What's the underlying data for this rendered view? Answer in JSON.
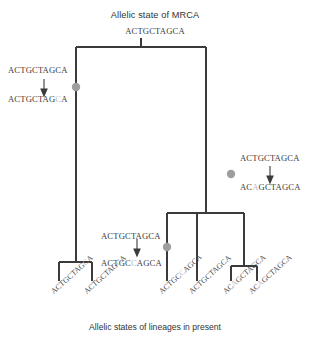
{
  "title": "Allelic state of MRCA",
  "caption": "Allelic states of lineages in present",
  "root": {
    "sequence": "ACTGCTAGCA"
  },
  "colors": {
    "branch": "#3b3b3b",
    "mutation_dot": "#9e9e9e",
    "mutant_base": "#bdbdbd",
    "text": "#333333"
  },
  "mutations": [
    {
      "id": "mutation-left",
      "before": "ACTGCTAGCA",
      "after_prefix": "ACTGCTAG",
      "after_mutant": "C",
      "after_suffix": "A",
      "dot_x": 76,
      "dot_y": 87
    },
    {
      "id": "mutation-middle",
      "before": "ACTGCTAGCA",
      "after_prefix": "ACTGC",
      "after_mutant": "C",
      "after_suffix": "AGCA",
      "dot_x": 167,
      "dot_y": 247
    },
    {
      "id": "mutation-right",
      "before": "ACTGCTAGCA",
      "after_prefix": "AC",
      "after_mutant": "A",
      "after_suffix": "GCTAGCA",
      "dot_x": 231,
      "dot_y": 174
    }
  ],
  "tips": [
    {
      "id": "tip-1",
      "prefix": "ACTGCTAG",
      "mutant": "C",
      "suffix": "A",
      "x": 59
    },
    {
      "id": "tip-2",
      "prefix": "ACTGCTAG",
      "mutant": "C",
      "suffix": "A",
      "x": 92
    },
    {
      "id": "tip-3",
      "prefix": "ACTGC",
      "mutant": "C",
      "suffix": "AGCA",
      "x": 167
    },
    {
      "id": "tip-4",
      "prefix": "ACTGCTAGCA",
      "mutant": "",
      "suffix": "",
      "x": 197
    },
    {
      "id": "tip-5",
      "prefix": "AC",
      "mutant": "A",
      "suffix": "GCTAGCA",
      "x": 231
    },
    {
      "id": "tip-6",
      "prefix": "AC",
      "mutant": "A",
      "suffix": "GCTAGCA",
      "x": 257
    }
  ],
  "tree": {
    "stem": {
      "x": 141,
      "y1": 38,
      "y2": 47
    },
    "root_bar": {
      "x1": 76,
      "x2": 206,
      "y": 47
    },
    "left_spine": {
      "x": 76,
      "y1": 47,
      "y2": 262
    },
    "left_bar": {
      "x1": 59,
      "x2": 92,
      "y": 262
    },
    "left_tip_a": {
      "x": 59,
      "y1": 262,
      "y2": 281
    },
    "left_tip_b": {
      "x": 92,
      "y1": 262,
      "y2": 281
    },
    "right_spine": {
      "x": 206,
      "y1": 47,
      "y2": 213
    },
    "right_bar": {
      "x1": 167,
      "x2": 244,
      "y": 213
    },
    "mid_tip": {
      "x": 167,
      "y1": 213,
      "y2": 281
    },
    "right_inner_spine": {
      "x": 244,
      "y1": 213,
      "y2": 266
    },
    "right_inner_bar": {
      "x1": 231,
      "x2": 257,
      "y": 266
    },
    "right_tip_a": {
      "x": 231,
      "y1": 266,
      "y2": 281
    },
    "right_tip_b": {
      "x": 257,
      "y1": 266,
      "y2": 281
    },
    "extra_spine": {
      "x": 197,
      "y1": 213,
      "y2": 281
    }
  }
}
